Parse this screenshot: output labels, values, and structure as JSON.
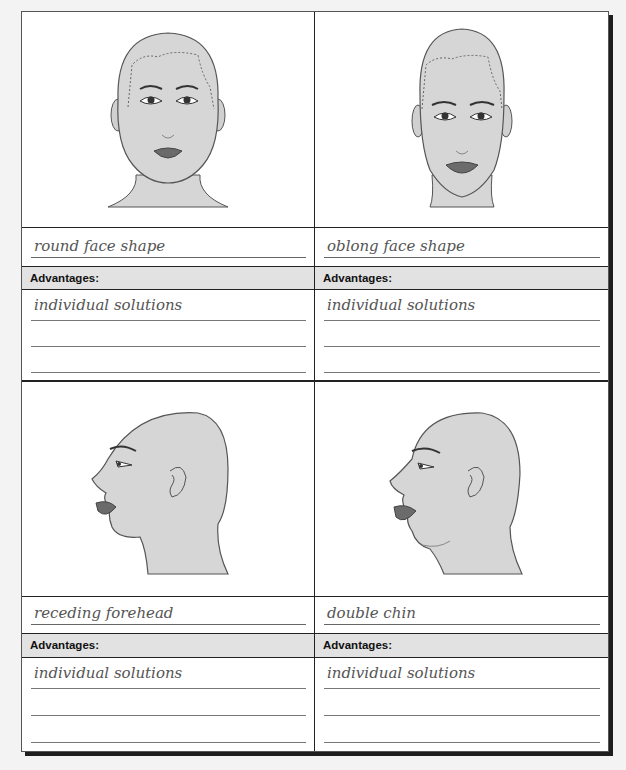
{
  "sheet": {
    "cards": [
      {
        "title": "round face shape",
        "advantages_label": "Advantages:",
        "advantages_lines": [
          "individual solutions",
          "",
          ""
        ],
        "illustration": "round-face-front-view"
      },
      {
        "title": "oblong face shape",
        "advantages_label": "Advantages:",
        "advantages_lines": [
          "individual solutions",
          "",
          ""
        ],
        "illustration": "oblong-face-front-view"
      },
      {
        "title": "receding forehead",
        "advantages_label": "Advantages:",
        "advantages_lines": [
          "individual solutions",
          "",
          ""
        ],
        "illustration": "receding-forehead-profile-view"
      },
      {
        "title": "double chin",
        "advantages_label": "Advantages:",
        "advantages_lines": [
          "individual solutions",
          "",
          ""
        ],
        "illustration": "double-chin-profile-view"
      }
    ]
  },
  "colors": {
    "skin": "#d6d6d6",
    "outline": "#555555",
    "lips": "#6b6b6b",
    "header_bg": "#e2e2e2"
  }
}
